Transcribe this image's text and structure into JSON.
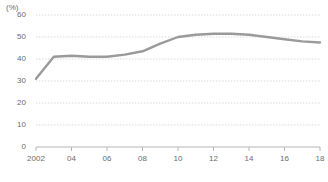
{
  "chart_data": {
    "type": "line",
    "title": "",
    "subtitle": "",
    "xlabel": "(年)",
    "ylabel": "(%)",
    "unit_label": "(%)",
    "x_unit_label": "(年)",
    "xlim": [
      2002,
      2018
    ],
    "ylim": [
      0,
      60
    ],
    "grid": true,
    "grid_axis": "y",
    "legend": "none",
    "line_color": "#9a9a9a",
    "text_color": "#6b6b6b",
    "grid_color": "#d9d9d9",
    "axis_color": "#b5b5b5",
    "background": "#ffffff",
    "y_ticks": [
      0,
      10,
      20,
      30,
      40,
      50,
      60
    ],
    "y_tick_labels": [
      "0",
      "10",
      "20",
      "30",
      "40",
      "50",
      "60"
    ],
    "x_ticks": [
      2002,
      2004,
      2006,
      2008,
      2010,
      2012,
      2014,
      2016,
      2018
    ],
    "x_tick_labels": [
      "2002",
      "04",
      "06",
      "08",
      "10",
      "12",
      "14",
      "16",
      "18"
    ],
    "x": [
      2002,
      2003,
      2004,
      2005,
      2006,
      2007,
      2008,
      2009,
      2010,
      2011,
      2012,
      2013,
      2014,
      2015,
      2016,
      2017,
      2018
    ],
    "values": [
      31,
      41,
      41.5,
      41,
      41,
      42,
      43.5,
      47,
      50,
      51,
      51.5,
      51.5,
      51,
      50,
      49,
      48,
      47.5
    ],
    "series": [
      {
        "name": "",
        "values": [
          31,
          41,
          41.5,
          41,
          41,
          42,
          43.5,
          47,
          50,
          51,
          51.5,
          51.5,
          51,
          50,
          49,
          48,
          47.5
        ]
      }
    ]
  },
  "geometry": {
    "plot_left": 36,
    "plot_right": 320,
    "plot_top": 15,
    "plot_bottom": 147
  }
}
